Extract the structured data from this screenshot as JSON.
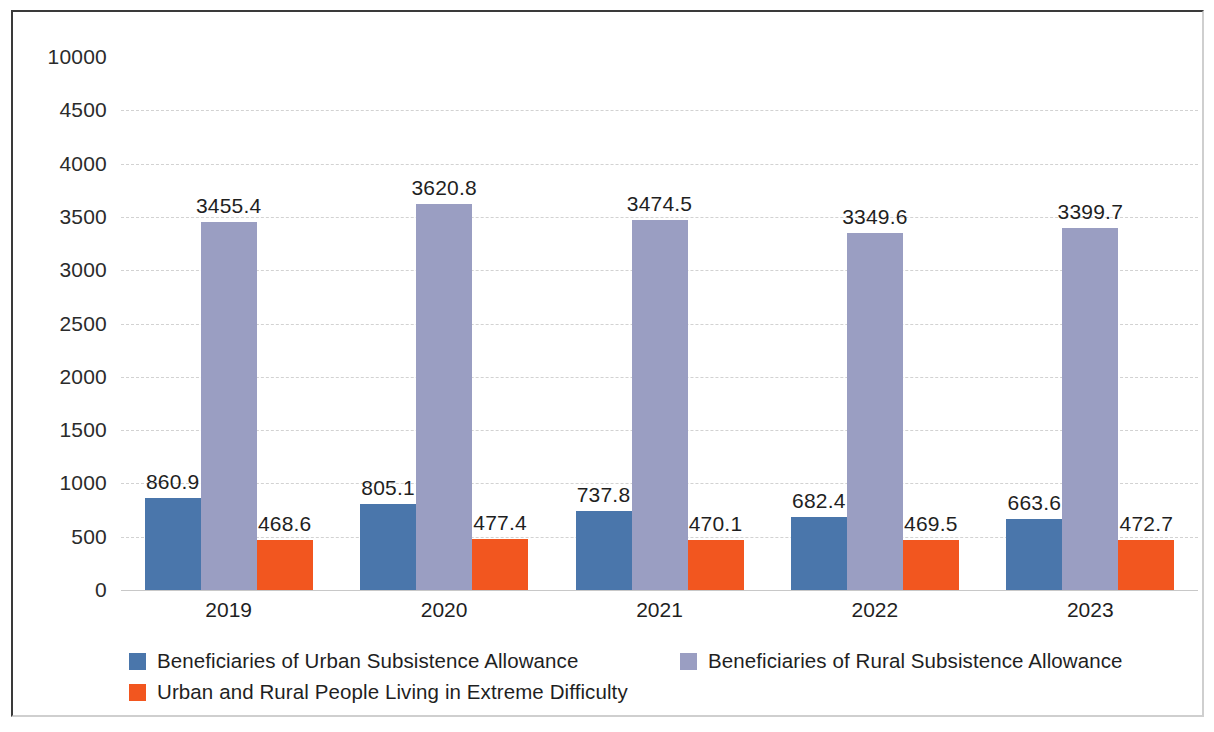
{
  "chart_data": {
    "type": "bar",
    "title": "",
    "subtitle": "",
    "xlabel": "",
    "ylabel": "",
    "categories": [
      "2019",
      "2020",
      "2021",
      "2022",
      "2023"
    ],
    "series": [
      {
        "name": "Beneficiaries of Urban Subsistence Allowance",
        "color": "#4a76ab",
        "values": [
          860.9,
          805.1,
          737.8,
          682.4,
          663.6
        ],
        "labels": [
          "860.9",
          "805.1",
          "737.8",
          "682.4",
          "663.6"
        ]
      },
      {
        "name": "Beneficiaries of Rural Subsistence Allowance",
        "color": "#9a9ec2",
        "values": [
          3455.4,
          3620.8,
          3474.5,
          3349.6,
          3399.7
        ],
        "labels": [
          "3455.4",
          "3620.8",
          "3474.5",
          "3349.6",
          "3399.7"
        ]
      },
      {
        "name": "Urban and Rural People Living in Extreme  Difficulty",
        "color": "#f2561f",
        "values": [
          468.6,
          477.4,
          470.1,
          469.5,
          472.7
        ],
        "labels": [
          "468.6",
          "477.4",
          "470.1",
          "469.5",
          "472.7"
        ]
      }
    ],
    "y_ticks": [
      "10000",
      "4500",
      "4000",
      "3500",
      "3000",
      "2500",
      "2000",
      "1500",
      "1000",
      "500",
      "0"
    ],
    "y_tick_values": [
      10000,
      4500,
      4000,
      3500,
      3000,
      2500,
      2000,
      1500,
      1000,
      500,
      0
    ],
    "ylim": [
      0,
      10000
    ],
    "grid": true,
    "grid_color": "#d2d2d2",
    "legend_position": "bottom",
    "note": "Y axis is non-linear at the top: ticks run 0..4500 evenly then jump to 10000."
  },
  "legend": {
    "items": [
      {
        "label": "Beneficiaries of Urban Subsistence Allowance",
        "color": "#4a76ab"
      },
      {
        "label": "Beneficiaries of Rural Subsistence Allowance",
        "color": "#9a9ec2"
      },
      {
        "label": "Urban and Rural People Living in Extreme  Difficulty",
        "color": "#f2561f"
      }
    ]
  }
}
